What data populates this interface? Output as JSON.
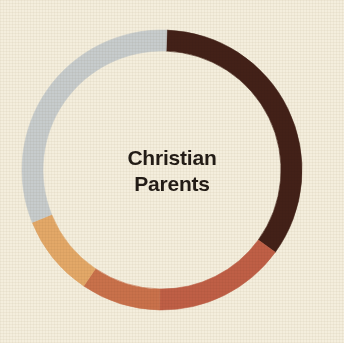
{
  "background_color": "#f4eedd",
  "center_label": {
    "line_1": "Christian",
    "line_2": "Parents",
    "text_color": "#231c16"
  },
  "chart_data": {
    "type": "pie",
    "variant": "donut",
    "title": "Christian Parents",
    "xlabel": "",
    "ylabel": "",
    "legend_position": "none",
    "grid": false,
    "center_x": 162,
    "center_y": 170,
    "outer_radius": 140,
    "inner_radius": 119,
    "ring_thickness": 21,
    "start_angle_deg": 2,
    "direction": "clockwise",
    "categories": [
      "Segment 1",
      "Segment 2",
      "Segment 3",
      "Segment 4",
      "Segment 5"
    ],
    "colors": [
      "#432118",
      "#bf5f46",
      "#c9714b",
      "#e3a868",
      "#c7cccd"
    ],
    "values": [
      34.4,
      15.3,
      9.2,
      9.4,
      31.7
    ],
    "slices": [
      {
        "name": "Segment 1",
        "color": "#432118",
        "value": 34.4,
        "start_angle_deg": 2,
        "end_angle_deg": 126,
        "sweep_deg": 124
      },
      {
        "name": "Segment 2",
        "color": "#bf5f46",
        "value": 15.3,
        "start_angle_deg": 126,
        "end_angle_deg": 181,
        "sweep_deg": 55
      },
      {
        "name": "Segment 3",
        "color": "#c9714b",
        "value": 9.2,
        "start_angle_deg": 181,
        "end_angle_deg": 214,
        "sweep_deg": 33
      },
      {
        "name": "Segment 4",
        "color": "#e3a868",
        "value": 9.4,
        "start_angle_deg": 214,
        "end_angle_deg": 248,
        "sweep_deg": 34
      },
      {
        "name": "Segment 5",
        "color": "#c7cccd",
        "value": 31.7,
        "start_angle_deg": 248,
        "end_angle_deg": 362,
        "sweep_deg": 114
      }
    ]
  }
}
